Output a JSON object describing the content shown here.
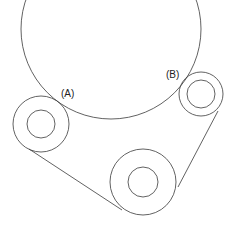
{
  "diagram": {
    "type": "belt-pulley-drive",
    "stroke_color": "#3a3a3a",
    "labels": {
      "a": "(A)",
      "b": "(B)"
    },
    "large_circle": {
      "cx": 111,
      "cy": 29,
      "r": 90
    },
    "pulleys": [
      {
        "id": "A",
        "cx": 41,
        "cy": 124,
        "r_outer": 28,
        "r_inner": 14
      },
      {
        "id": "B",
        "cx": 201,
        "cy": 94,
        "r_outer": 22,
        "r_inner": 14
      },
      {
        "id": "C",
        "cx": 143,
        "cy": 182,
        "r_outer": 33,
        "r_inner": 15
      }
    ],
    "belt_segments": [
      {
        "from": [
          29,
          149
        ],
        "to": [
          122,
          210
        ]
      },
      {
        "from": [
          218,
          111
        ],
        "to": [
          178,
          187
        ]
      }
    ]
  }
}
